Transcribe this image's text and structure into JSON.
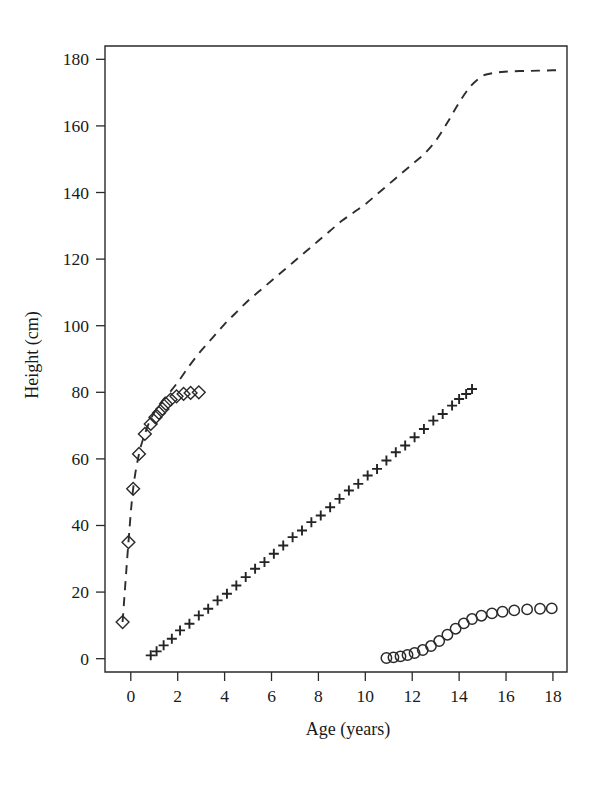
{
  "chart_data": {
    "type": "scatter",
    "title": "",
    "xlabel": "Age (years)",
    "ylabel": "Height (cm)",
    "xlim": [
      -1.1,
      18.6
    ],
    "ylim": [
      -4,
      184
    ],
    "grid": false,
    "legend": "none",
    "x_ticks": [
      0,
      2,
      4,
      6,
      8,
      10,
      12,
      14,
      16,
      18
    ],
    "x_tick_labels": [
      "0",
      "2",
      "4",
      "6",
      "8",
      "10",
      "12",
      "14",
      "16",
      "18"
    ],
    "y_ticks": [
      0,
      20,
      40,
      60,
      80,
      100,
      120,
      140,
      160,
      180
    ],
    "y_tick_labels": [
      "0",
      "20",
      "40",
      "60",
      "80",
      "100",
      "120",
      "140",
      "160",
      "180"
    ],
    "series": [
      {
        "name": "total height",
        "marker": "dashed-line",
        "style": "dashed",
        "x": [
          -0.35,
          -0.1,
          0.1,
          0.35,
          0.6,
          0.85,
          1.1,
          1.35,
          1.6,
          2.0,
          2.5,
          3.0,
          3.5,
          4.0,
          4.5,
          5.0,
          5.5,
          6.0,
          6.5,
          7.0,
          7.5,
          8.0,
          8.5,
          9.0,
          9.5,
          10.0,
          10.5,
          11.0,
          11.5,
          12.0,
          12.5,
          13.0,
          13.5,
          14.0,
          14.5,
          15.0,
          15.4,
          15.8,
          16.2,
          16.8,
          17.4,
          18.0,
          18.4
        ],
        "y": [
          11.0,
          35.0,
          51.0,
          61.5,
          67.5,
          72.0,
          75.0,
          77.5,
          79.5,
          83.0,
          88.0,
          92.5,
          96.5,
          100.5,
          104.0,
          107.5,
          110.5,
          113.5,
          116.5,
          119.5,
          122.5,
          125.5,
          128.5,
          131.5,
          134.0,
          136.5,
          139.5,
          142.5,
          145.5,
          148.5,
          151.5,
          155.5,
          161.0,
          167.0,
          172.0,
          175.0,
          175.8,
          176.2,
          176.4,
          176.5,
          176.6,
          176.7,
          176.7
        ]
      },
      {
        "name": "trunk height",
        "marker": "diamond",
        "x": [
          -0.35,
          -0.1,
          0.1,
          0.35,
          0.6,
          0.85,
          1.05,
          1.2,
          1.35,
          1.5,
          1.7,
          1.95,
          2.25,
          2.55,
          2.9
        ],
        "y": [
          11.0,
          35.0,
          51.0,
          61.5,
          67.5,
          70.5,
          72.5,
          73.8,
          75.0,
          76.5,
          77.8,
          78.8,
          79.5,
          79.8,
          80.0
        ]
      },
      {
        "name": "leg length",
        "marker": "plus",
        "x": [
          0.85,
          1.1,
          1.4,
          1.75,
          2.1,
          2.5,
          2.9,
          3.3,
          3.7,
          4.1,
          4.5,
          4.9,
          5.3,
          5.7,
          6.1,
          6.5,
          6.9,
          7.3,
          7.7,
          8.1,
          8.5,
          8.9,
          9.3,
          9.7,
          10.1,
          10.5,
          10.9,
          11.3,
          11.7,
          12.1,
          12.5,
          12.9,
          13.3,
          13.7,
          14.0,
          14.3,
          14.55
        ],
        "y": [
          1.0,
          2.2,
          4.0,
          6.0,
          8.5,
          10.5,
          13.0,
          15.0,
          17.5,
          19.5,
          22.0,
          24.5,
          27.0,
          29.0,
          31.5,
          34.0,
          36.5,
          38.5,
          41.0,
          43.0,
          45.5,
          48.0,
          50.5,
          52.5,
          55.0,
          57.0,
          59.5,
          62.0,
          64.0,
          66.5,
          69.0,
          71.5,
          73.5,
          76.0,
          78.0,
          79.5,
          81.0
        ]
      },
      {
        "name": "sitting increment",
        "marker": "circle",
        "x": [
          10.9,
          11.2,
          11.5,
          11.8,
          12.1,
          12.45,
          12.8,
          13.15,
          13.5,
          13.85,
          14.2,
          14.55,
          14.95,
          15.4,
          15.85,
          16.35,
          16.9,
          17.45,
          17.95
        ],
        "y": [
          0.2,
          0.4,
          0.7,
          1.1,
          1.7,
          2.6,
          3.8,
          5.3,
          7.2,
          9.0,
          10.6,
          11.9,
          12.9,
          13.6,
          14.1,
          14.5,
          14.8,
          15.0,
          15.1
        ]
      }
    ]
  },
  "figure": {
    "background_color": "#ffffff",
    "ink_color": "#2a2a2a"
  }
}
